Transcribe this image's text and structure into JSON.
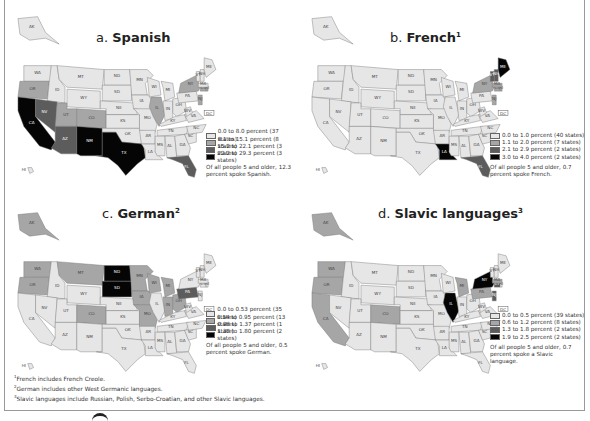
{
  "figure": {
    "panels": [
      {
        "letter": "a.",
        "language": "Spanish",
        "superscript": "",
        "legend": [
          {
            "label": "0.0 to 8.0 percent (37 states)",
            "color": "#e6e6e6"
          },
          {
            "label": "8.1 to 15.1 percent (8 states)",
            "color": "#a6a6a6"
          },
          {
            "label": "15.2 to 22.1 percent (3 states)",
            "color": "#5c5c5c"
          },
          {
            "label": "22.2 to 29.3 percent (3 states)",
            "color": "#050505"
          }
        ],
        "note": "Of all people 5 and older, 12.3 percent spoke Spanish.",
        "state_classes": {
          "CA": 3,
          "TX": 3,
          "NM": 3,
          "NV": 2,
          "AZ": 2,
          "FL": 2,
          "OR": 1,
          "UT": 1,
          "CO": 1,
          "IL": 1,
          "NY": 1,
          "NJ": 1,
          "CT": 1,
          "RI": 1
        }
      },
      {
        "letter": "b.",
        "language": "French",
        "superscript": "1",
        "legend": [
          {
            "label": "0.0 to 1.0 percent (40 states)",
            "color": "#e6e6e6"
          },
          {
            "label": "1.1 to 2.0 percent (7 states)",
            "color": "#a6a6a6"
          },
          {
            "label": "2.1 to 2.9 percent (2 states)",
            "color": "#5c5c5c"
          },
          {
            "label": "3.0 to 4.0  percent (2 states)",
            "color": "#050505"
          }
        ],
        "note": "Of all people 5 and older, 0.7 percent spoke French.",
        "state_classes": {
          "ME": 3,
          "LA": 3,
          "NH": 2,
          "VT": 2,
          "FL": 2,
          "NY": 1,
          "MA": 1,
          "CT": 1,
          "RI": 1,
          "NJ": 1
        }
      },
      {
        "letter": "c.",
        "language": "German",
        "superscript": "2",
        "legend": [
          {
            "label": "0.0 to 0.53 percent (35 states)",
            "color": "#e6e6e6"
          },
          {
            "label": "0.54 to 0.95 percent (13 states)",
            "color": "#a6a6a6"
          },
          {
            "label": "0.96 to 1.37 percent (1 state)",
            "color": "#5c5c5c"
          },
          {
            "label": "1.38 to 1.80 percent (2 states)",
            "color": "#050505"
          }
        ],
        "note": "Of all people 5 and older, 0.5 percent spoke German.",
        "state_classes": {
          "ND": 3,
          "SD": 3,
          "PA": 2,
          "AK": 1,
          "WA": 1,
          "OR": 1,
          "MT": 1,
          "MN": 1,
          "WI": 1,
          "MI": 1,
          "IA": 1,
          "MO": 1,
          "IN": 1,
          "OH": 1,
          "CO": 1
        }
      },
      {
        "letter": "d.",
        "language": "Slavic languages",
        "superscript": "3",
        "legend": [
          {
            "label": "0.0 to 0.5 percent (39 states)",
            "color": "#e6e6e6"
          },
          {
            "label": "0.6 to 1.2 percent (8 states)",
            "color": "#a6a6a6"
          },
          {
            "label": "1.3 to 1.8 percent (2 states)",
            "color": "#5c5c5c"
          },
          {
            "label": "1.9 to 2.5 percent (2 states)",
            "color": "#050505"
          }
        ],
        "note": "Of all people 5 and older, 0.7 percent spoke a Slavic language.",
        "state_classes": {
          "IL": 3,
          "NY": 3,
          "NJ": 2,
          "CT": 2,
          "AK": 1,
          "WA": 1,
          "OR": 1,
          "CA": 1,
          "CO": 1,
          "MI": 1,
          "PA": 1,
          "MA": 1
        }
      }
    ],
    "footnotes": [
      {
        "mark": "1",
        "text": "French includes French Creole."
      },
      {
        "mark": "2",
        "text": "German includes other West Germanic languages."
      },
      {
        "mark": "3",
        "text": "Slavic languages include Russian, Polish, Serbo-Croatian, and other Slavic languages."
      }
    ]
  }
}
